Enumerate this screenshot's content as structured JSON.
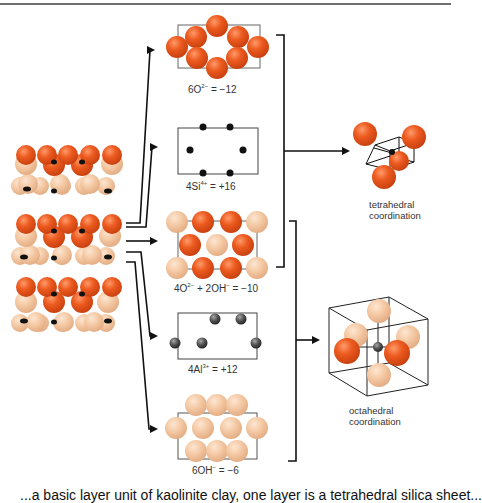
{
  "colors": {
    "oxygen": "#e8531c",
    "hydroxyl": "#f2c7a3",
    "silicon": "#111111",
    "aluminum": "#555555",
    "line": "#111111",
    "box": "#555555"
  },
  "layers": [
    {
      "id": "oxygen-layer",
      "label_parts": {
        "coef": "6O",
        "sup": "2−",
        "rest": " = −12"
      }
    },
    {
      "id": "silicon-layer",
      "label_parts": {
        "coef": "4Si",
        "sup": "4+",
        "rest": " = +16"
      }
    },
    {
      "id": "mixed-oxygen-hydroxyl-layer",
      "label_parts": {
        "coef": "4O",
        "sup": "2−",
        "mid": " + 2OH",
        "sup2": "−",
        "rest": " = −10"
      }
    },
    {
      "id": "aluminum-layer",
      "label_parts": {
        "coef": "4Al",
        "sup": "3+",
        "rest": " = +12"
      }
    },
    {
      "id": "hydroxyl-layer",
      "label_parts": {
        "coef": "6OH",
        "sup": "−",
        "rest": " = −6"
      }
    }
  ],
  "coordination": {
    "tetrahedral": {
      "line1": "tetrahedral",
      "line2": "coordination"
    },
    "octahedral": {
      "line1": "octahedral",
      "line2": "coordination"
    }
  },
  "footer": {
    "text": "...a basic layer unit of kaolinite clay, one layer is a tetrahedral silica sheet..."
  }
}
